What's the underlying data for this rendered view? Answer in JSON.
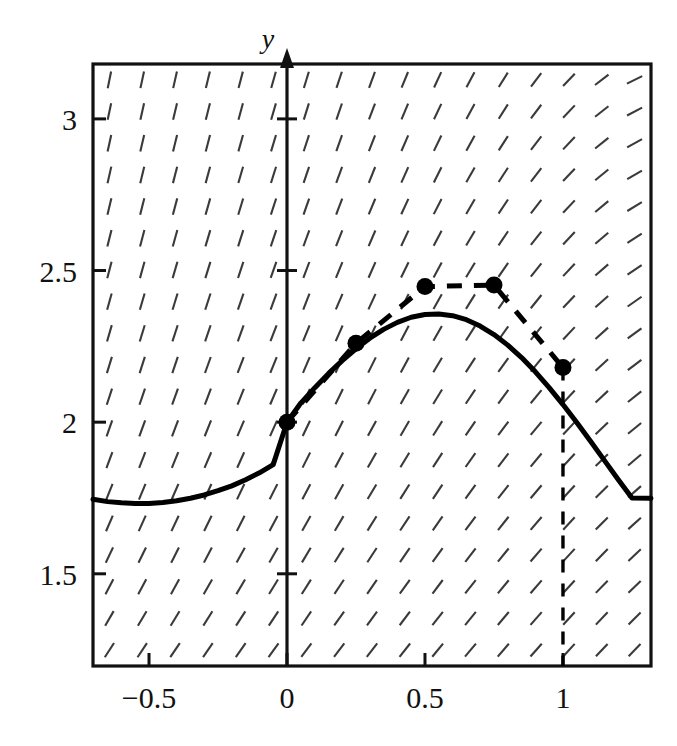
{
  "figure": {
    "background": "#ffffff",
    "ink": "#111111",
    "slope_field_color": "#3a3a3a",
    "solution_curve_color": "#000000",
    "euler_color": "#000000"
  },
  "axes": {
    "y_axis_label": "y",
    "x_axis_label": "",
    "xlim": [
      -0.703,
      1.319
    ],
    "ylim": [
      1.196,
      3.181
    ],
    "x_ticks": [
      -0.5,
      0,
      0.5,
      1
    ],
    "x_tick_labels": [
      "−0.5",
      "0",
      "0.5",
      "1"
    ],
    "y_ticks": [
      1.5,
      2,
      2.5,
      3
    ],
    "y_tick_labels": [
      "1.5",
      "2",
      "2.5",
      "3"
    ],
    "grid": false,
    "frame": true
  },
  "chart_data": {
    "type": "line",
    "title": "",
    "subtitle": "",
    "xlabel": "",
    "ylabel": "y",
    "xlim": [
      -0.703,
      1.319
    ],
    "ylim": [
      1.196,
      3.181
    ],
    "grid": false,
    "legend": "none",
    "annotations": [
      "Slope field of dy/dx = x + y − x*y rendered as short dashes on a grid",
      "Vertical dashed drop line at x = 1 from the Euler endpoint down to the axis"
    ],
    "series": [
      {
        "name": "exact-solution",
        "type": "line",
        "style": "solid",
        "linewidth": 4.5,
        "color": "#000000",
        "x": [
          -0.703,
          -0.65,
          -0.6,
          -0.55,
          -0.5,
          -0.45,
          -0.4,
          -0.35,
          -0.3,
          -0.25,
          -0.2,
          -0.15,
          -0.1,
          -0.05,
          0.0,
          0.05,
          0.1,
          0.15,
          0.2,
          0.25,
          0.3,
          0.35,
          0.4,
          0.45,
          0.5,
          0.55,
          0.6,
          0.65,
          0.7,
          0.75,
          0.8,
          0.85,
          0.9,
          0.95,
          1.0,
          1.05,
          1.1,
          1.15,
          1.2,
          1.25,
          1.319
        ],
        "y": [
          1.746,
          1.738,
          1.734,
          1.732,
          1.732,
          1.735,
          1.741,
          1.749,
          1.76,
          1.774,
          1.79,
          1.81,
          1.833,
          1.86,
          2.0,
          2.063,
          2.113,
          2.16,
          2.203,
          2.242,
          2.277,
          2.306,
          2.329,
          2.346,
          2.355,
          2.357,
          2.351,
          2.338,
          2.317,
          2.289,
          2.254,
          2.213,
          2.166,
          2.114,
          2.058,
          1.999,
          1.937,
          1.874,
          1.811,
          1.75,
          1.749
        ]
      },
      {
        "name": "euler-approximation",
        "type": "line",
        "style": "dashed",
        "linewidth": 4.5,
        "marker": "filled-circle",
        "marker_size": 17,
        "color": "#000000",
        "step_h": 0.25,
        "x": [
          0,
          0.25,
          0.5,
          0.75,
          1
        ],
        "y": [
          2.0,
          2.26,
          2.447,
          2.452,
          2.18
        ]
      }
    ],
    "slope_field": {
      "ode": "dy/dx = x + y - x*y",
      "dash_length": 17,
      "x_samples": 17,
      "y_samples": 19,
      "color": "#3a3a3a"
    }
  }
}
